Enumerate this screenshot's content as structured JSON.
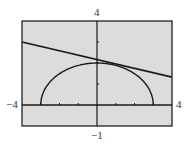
{
  "chart_data": {
    "type": "line",
    "title": "",
    "xlabel": "",
    "ylabel": "",
    "xlim": [
      -4,
      4
    ],
    "ylim": [
      -1,
      4
    ],
    "grid": false,
    "legend": null,
    "window_labels": {
      "xmin": "−4",
      "xmax": "4",
      "ymin": "−1",
      "ymax": "4"
    },
    "x_ticks": [
      -3,
      -2,
      -1,
      1,
      2,
      3
    ],
    "y_ticks": [
      1,
      2,
      3
    ],
    "series": [
      {
        "name": "line",
        "kind": "straight line",
        "x": [
          -4,
          4
        ],
        "y": [
          3.0,
          1.33
        ]
      },
      {
        "name": "upper-semicircle",
        "kind": "upper half of circle/ellipse",
        "x": [
          -3,
          -2.5,
          -2,
          -1.5,
          -1,
          -0.5,
          0,
          0.5,
          1,
          1.5,
          2,
          2.5,
          3
        ],
        "y": [
          0,
          1.11,
          1.49,
          1.73,
          1.89,
          1.97,
          2.0,
          1.97,
          1.89,
          1.73,
          1.49,
          1.11,
          0
        ]
      }
    ],
    "annotations": [
      "line appears tangent to the curve near its top at about (0, 2)"
    ]
  },
  "style": {
    "plot_background": "#dcdcdc",
    "frame_color": "#222222",
    "curve_color": "#1a1a1a"
  }
}
